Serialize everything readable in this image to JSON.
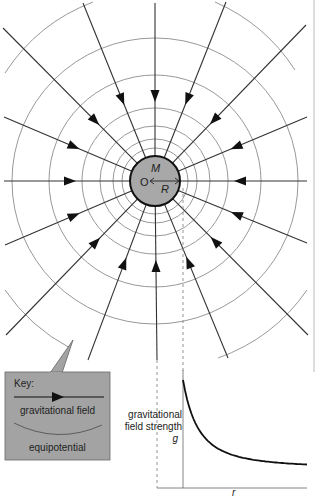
{
  "field_diagram": {
    "mass_label": "M",
    "center_label": "O",
    "radius_label": "R",
    "center": [
      155,
      181
    ],
    "body_radius": 25,
    "equipotential_radii": [
      33,
      42,
      55,
      73,
      106,
      143
    ],
    "outer_arc_radius": 182,
    "field_line_endpoints": [
      [
        155,
        3
      ],
      [
        226,
        2
      ],
      [
        306,
        25
      ],
      [
        307,
        117
      ],
      [
        307,
        181
      ],
      [
        307,
        243
      ],
      [
        308,
        335
      ],
      [
        228,
        358
      ],
      [
        157,
        360
      ],
      [
        88,
        360
      ],
      [
        6,
        335
      ],
      [
        5,
        245
      ],
      [
        4,
        181
      ],
      [
        4,
        117
      ],
      [
        3,
        28
      ],
      [
        83,
        3
      ]
    ],
    "colors": {
      "body_fill": "#a8a8a8",
      "field_line": "#333333",
      "equipotential": "#8c8c8c"
    }
  },
  "key": {
    "title": "Key:",
    "field_label": "gravitational field",
    "equipotential_label": "equipotential",
    "box_fill": "#a3a3a3"
  },
  "chart_data": {
    "type": "line",
    "title": "",
    "xlabel": "r",
    "ylabel": "gravitational field strength g",
    "ylabel_line1": "gravitational",
    "ylabel_line2": "field strength",
    "ylabel_symbol": "g",
    "grid": false,
    "series": [
      {
        "name": "g(r)",
        "x": [
          1.0,
          1.2,
          1.5,
          2.0,
          2.5,
          3.0,
          4.0,
          5.0
        ],
        "y": [
          1.0,
          0.69,
          0.44,
          0.25,
          0.16,
          0.11,
          0.06,
          0.04
        ]
      }
    ]
  }
}
